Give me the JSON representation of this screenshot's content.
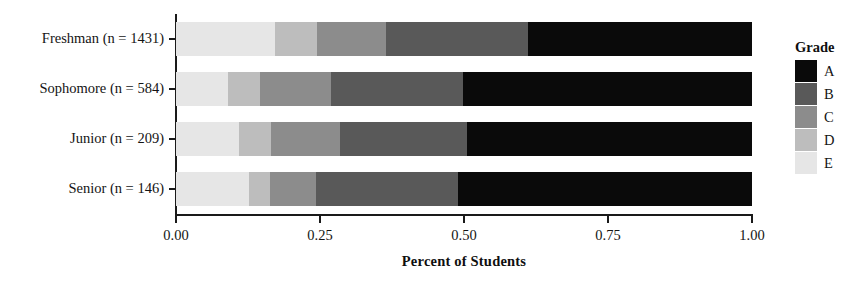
{
  "chart_data": {
    "type": "bar",
    "orientation": "horizontal",
    "stacked": true,
    "normalized": true,
    "title": "",
    "xlabel": "Percent of Students",
    "ylabel": "",
    "xlim": [
      0.0,
      1.0
    ],
    "xticks": [
      0.0,
      0.25,
      0.5,
      0.75,
      1.0
    ],
    "xticklabels": [
      "0.00",
      "0.25",
      "0.50",
      "0.75",
      "1.00"
    ],
    "grid": false,
    "legend": {
      "title": "Grade",
      "position": "right",
      "entries": [
        {
          "label": "A",
          "color": "#0a0a0a"
        },
        {
          "label": "B",
          "color": "#595959"
        },
        {
          "label": "C",
          "color": "#8c8c8c"
        },
        {
          "label": "D",
          "color": "#bdbdbd"
        },
        {
          "label": "E",
          "color": "#e6e6e6"
        }
      ]
    },
    "categories": [
      "Freshman (n = 1431)",
      "Sophomore (n = 584)",
      "Junior (n = 209)",
      "Senior (n = 146)"
    ],
    "series": [
      {
        "name": "E",
        "color": "#e6e6e6",
        "values": [
          0.172,
          0.09,
          0.109,
          0.127
        ]
      },
      {
        "name": "D",
        "color": "#bdbdbd",
        "values": [
          0.072,
          0.056,
          0.056,
          0.036
        ]
      },
      {
        "name": "C",
        "color": "#8c8c8c",
        "values": [
          0.121,
          0.123,
          0.12,
          0.08
        ]
      },
      {
        "name": "B",
        "color": "#595959",
        "values": [
          0.246,
          0.229,
          0.22,
          0.246
        ]
      },
      {
        "name": "A",
        "color": "#0a0a0a",
        "values": [
          0.389,
          0.502,
          0.495,
          0.511
        ]
      }
    ],
    "stacks": [
      {
        "category": "Freshman (n = 1431)",
        "segments": [
          {
            "grade": "E",
            "value": 0.172,
            "cum_start": 0.0,
            "cum_end": 0.172,
            "color": "#e6e6e6"
          },
          {
            "grade": "D",
            "value": 0.072,
            "cum_start": 0.172,
            "cum_end": 0.244,
            "color": "#bdbdbd"
          },
          {
            "grade": "C",
            "value": 0.121,
            "cum_start": 0.244,
            "cum_end": 0.365,
            "color": "#8c8c8c"
          },
          {
            "grade": "B",
            "value": 0.246,
            "cum_start": 0.365,
            "cum_end": 0.611,
            "color": "#595959"
          },
          {
            "grade": "A",
            "value": 0.389,
            "cum_start": 0.611,
            "cum_end": 1.0,
            "color": "#0a0a0a"
          }
        ]
      },
      {
        "category": "Sophomore (n = 584)",
        "segments": [
          {
            "grade": "E",
            "value": 0.09,
            "cum_start": 0.0,
            "cum_end": 0.09,
            "color": "#e6e6e6"
          },
          {
            "grade": "D",
            "value": 0.056,
            "cum_start": 0.09,
            "cum_end": 0.146,
            "color": "#bdbdbd"
          },
          {
            "grade": "C",
            "value": 0.123,
            "cum_start": 0.146,
            "cum_end": 0.269,
            "color": "#8c8c8c"
          },
          {
            "grade": "B",
            "value": 0.229,
            "cum_start": 0.269,
            "cum_end": 0.498,
            "color": "#595959"
          },
          {
            "grade": "A",
            "value": 0.502,
            "cum_start": 0.498,
            "cum_end": 1.0,
            "color": "#0a0a0a"
          }
        ]
      },
      {
        "category": "Junior (n = 209)",
        "segments": [
          {
            "grade": "E",
            "value": 0.109,
            "cum_start": 0.0,
            "cum_end": 0.109,
            "color": "#e6e6e6"
          },
          {
            "grade": "D",
            "value": 0.056,
            "cum_start": 0.109,
            "cum_end": 0.165,
            "color": "#bdbdbd"
          },
          {
            "grade": "C",
            "value": 0.12,
            "cum_start": 0.165,
            "cum_end": 0.285,
            "color": "#8c8c8c"
          },
          {
            "grade": "B",
            "value": 0.22,
            "cum_start": 0.285,
            "cum_end": 0.505,
            "color": "#595959"
          },
          {
            "grade": "A",
            "value": 0.495,
            "cum_start": 0.505,
            "cum_end": 1.0,
            "color": "#0a0a0a"
          }
        ]
      },
      {
        "category": "Senior (n = 146)",
        "segments": [
          {
            "grade": "E",
            "value": 0.127,
            "cum_start": 0.0,
            "cum_end": 0.127,
            "color": "#e6e6e6"
          },
          {
            "grade": "D",
            "value": 0.036,
            "cum_start": 0.127,
            "cum_end": 0.163,
            "color": "#bdbdbd"
          },
          {
            "grade": "C",
            "value": 0.08,
            "cum_start": 0.163,
            "cum_end": 0.243,
            "color": "#8c8c8c"
          },
          {
            "grade": "B",
            "value": 0.246,
            "cum_start": 0.243,
            "cum_end": 0.489,
            "color": "#595959"
          },
          {
            "grade": "A",
            "value": 0.511,
            "cum_start": 0.489,
            "cum_end": 1.0,
            "color": "#0a0a0a"
          }
        ]
      }
    ]
  }
}
